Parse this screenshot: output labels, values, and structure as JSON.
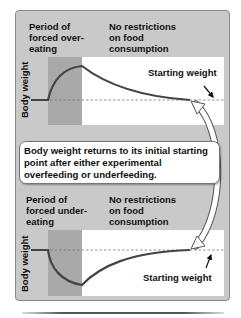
{
  "colors": {
    "panel_bg": "#c9c9c9",
    "forced_period_shade": "#a9a9a9",
    "plot_bg": "#ffffff",
    "curve": "#444444",
    "baseline_dash": "#777777"
  },
  "top_panel": {
    "period_label": "Period of\nforced over-\neating",
    "free_label": "No restrictions\non food\nconsumption",
    "y_axis_label": "Body weight",
    "annotation": "Starting weight"
  },
  "callout": {
    "text": "Body weight returns to its initial starting point after either experimental overfeeding or underfeeding."
  },
  "bottom_panel": {
    "period_label": "Period of\nforced under-\neating",
    "free_label": "No restrictions\non food\nconsumption",
    "y_axis_label": "Body weight",
    "annotation": "Starting weight"
  }
}
